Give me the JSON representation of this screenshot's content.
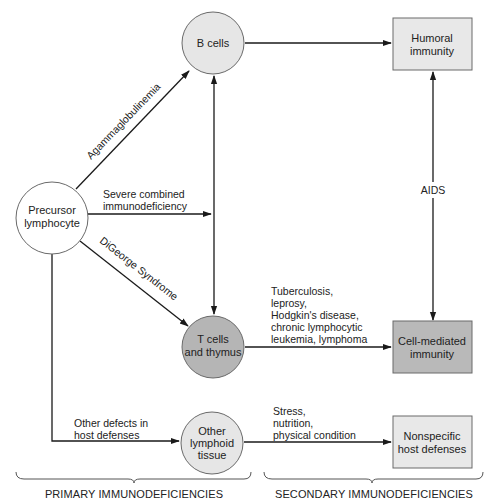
{
  "diagram": {
    "colors": {
      "line": "#1a1a1a",
      "circle_light": "#e6e6e6",
      "circle_dark": "#b5b5b5",
      "circle_white": "#ffffff",
      "box_light": "#e8e8e8",
      "box_dark": "#b9b9b9",
      "stroke": "#6a6a6a"
    },
    "nodes": {
      "precursor": {
        "line1": "Precursor",
        "line2": "lymphocyte"
      },
      "b_cells": {
        "line1": "B cells"
      },
      "t_cells": {
        "line1": "T cells",
        "line2": "and thymus"
      },
      "other_lymphoid": {
        "line1": "Other",
        "line2": "lymphoid",
        "line3": "tissue"
      },
      "humoral": {
        "line1": "Humoral",
        "line2": "immunity"
      },
      "cell_mediated": {
        "line1": "Cell-mediated",
        "line2": "immunity"
      },
      "nonspecific": {
        "line1": "Nonspecific",
        "line2": "host defenses"
      }
    },
    "edges": {
      "agammaglobulinemia": "Agammaglobulinemia",
      "scid": {
        "line1": "Severe combined",
        "line2": "immunodeficiency"
      },
      "digeorge": "DiGeorge Syndrome",
      "other_defects": {
        "line1": "Other defects in",
        "line2": "host defenses"
      },
      "aids": "AIDS",
      "t_secondary": {
        "line1": "Tuberculosis,",
        "line2": "leprosy,",
        "line3": "Hodgkin's disease,",
        "line4": "chronic lymphocytic",
        "line5": "leukemia, lymphoma"
      },
      "nonspecific_secondary": {
        "line1": "Stress,",
        "line2": "nutrition,",
        "line3": "physical condition"
      }
    },
    "sections": {
      "primary": "PRIMARY IMMUNODEFICIENCIES",
      "secondary": "SECONDARY IMMUNODEFICIENCIES"
    }
  }
}
